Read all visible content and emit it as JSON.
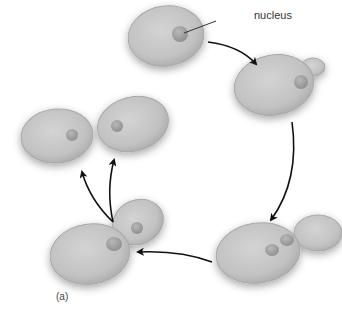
{
  "diagram": {
    "labels": {
      "nucleus": "nucleus",
      "panel": "(a)"
    },
    "colors": {
      "cell_fill": "#c2c2c2",
      "cell_edge": "#a8a8a8",
      "nucleus_fill": "#9e9e9e",
      "arrow": "#111111",
      "background": "#ffffff"
    },
    "stages": [
      {
        "id": 1,
        "description": "single cell with nucleus",
        "position": "top-center"
      },
      {
        "id": 2,
        "description": "cell forming bud",
        "position": "right-upper"
      },
      {
        "id": 3,
        "description": "bud enlarged, nucleus dividing",
        "position": "bottom-right"
      },
      {
        "id": 4,
        "description": "bud separating from mother cell",
        "position": "bottom-left"
      },
      {
        "id": 5,
        "description": "two separate daughter cells",
        "position": "left-upper"
      }
    ]
  }
}
